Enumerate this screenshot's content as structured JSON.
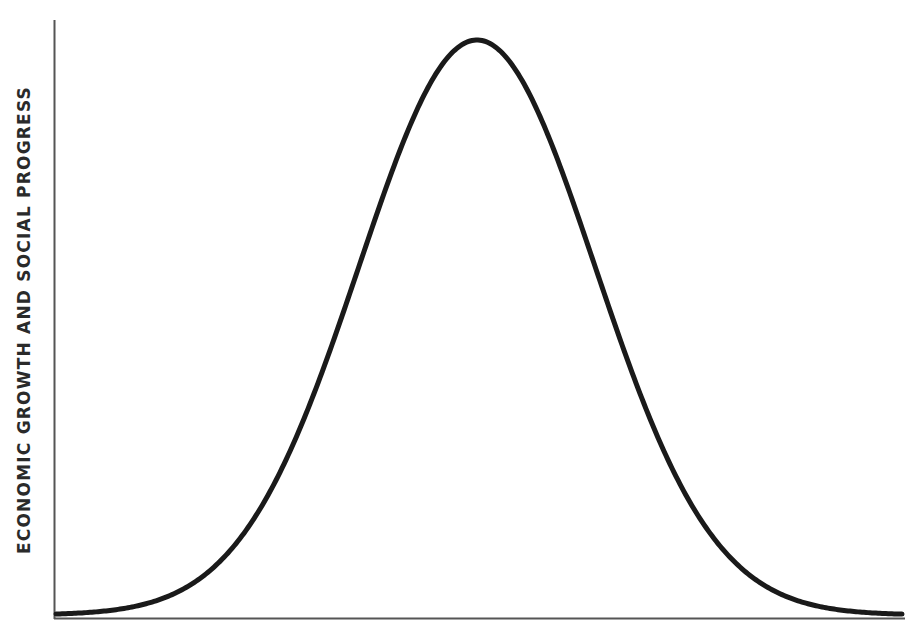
{
  "chart_data": {
    "type": "line",
    "title": "",
    "xlabel": "",
    "ylabel": "ECONOMIC GROWTH AND SOCIAL PROGRESS",
    "grid": false,
    "legend": null,
    "x": [
      0,
      0.1,
      0.2,
      0.3,
      0.35,
      0.4,
      0.45,
      0.5,
      0.55,
      0.6,
      0.65,
      0.7,
      0.8,
      0.9,
      1.0
    ],
    "values": [
      0.0,
      0.01,
      0.06,
      0.27,
      0.48,
      0.74,
      0.94,
      1.0,
      0.9,
      0.71,
      0.46,
      0.26,
      0.06,
      0.01,
      0.0
    ],
    "xlim": [
      0,
      1
    ],
    "ylim": [
      0,
      1.04
    ],
    "peak": {
      "x": 0.5,
      "y": 1.0
    },
    "colors": {
      "curve": "#1a1a1a",
      "axis": "#555555"
    }
  }
}
